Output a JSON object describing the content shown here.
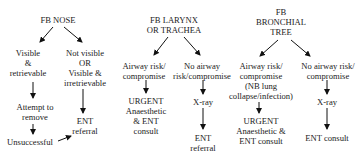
{
  "diagram": {
    "columns": [
      {
        "id": "nose",
        "title": [
          "FB NOSE"
        ],
        "branches": [
          {
            "condition": [
              "Visible",
              "&",
              "retrievable"
            ],
            "steps": [
              [
                "Attempt to",
                "remove"
              ],
              [
                "Unsuccessful"
              ]
            ]
          },
          {
            "condition": [
              "Not visible",
              "OR",
              "Visible &",
              "irretrievable"
            ],
            "steps": [
              [
                "ENT",
                "referral"
              ]
            ]
          }
        ],
        "cross_link": {
          "from": "Unsuccessful",
          "to": "ENT referral"
        }
      },
      {
        "id": "larynx",
        "title": [
          "FB LARYNX",
          "OR TRACHEA"
        ],
        "branches": [
          {
            "condition": [
              "Airway risk/",
              "compromise"
            ],
            "steps": [
              [
                "URGENT",
                "Anaesthetic",
                "& ENT",
                "consult"
              ]
            ]
          },
          {
            "condition": [
              "No airway",
              "risk/compromise"
            ],
            "steps": [
              [
                "X-ray"
              ],
              [
                "ENT",
                "referral"
              ]
            ]
          }
        ]
      },
      {
        "id": "bronchial",
        "title": [
          "FB",
          "BRONCHIAL",
          "TREE"
        ],
        "branches": [
          {
            "condition": [
              "Airway risk/",
              "compromise",
              "(NB lung",
              "collapse/infection)"
            ],
            "steps": [
              [
                "URGENT",
                "Anaesthetic &",
                "ENT consult"
              ]
            ]
          },
          {
            "condition": [
              "No airway risk/",
              "compromise"
            ],
            "steps": [
              [
                "X-ray"
              ],
              [
                "ENT consult"
              ]
            ]
          }
        ]
      }
    ],
    "colors": {
      "text": "#222222",
      "arrow": "#111111",
      "background": "#ffffff"
    }
  }
}
